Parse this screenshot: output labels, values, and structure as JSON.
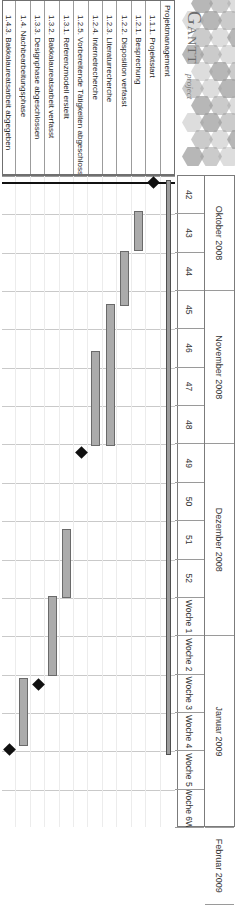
{
  "app": {
    "logo_word": "Gantt",
    "logo_sub": "project",
    "logo_icon": "honeycomb-logo"
  },
  "timeline": {
    "months": [
      {
        "label": "Oktober 2008",
        "weeks": 3
      },
      {
        "label": "November 2008",
        "weeks": 4
      },
      {
        "label": "Dezember 2008",
        "weeks": 5
      },
      {
        "label": "Januar 2009",
        "weeks": 5
      },
      {
        "label": "Februar 2009",
        "weeks": 2
      }
    ],
    "weeks": [
      "42",
      "43",
      "44",
      "45",
      "46",
      "47",
      "48",
      "49",
      "50",
      "51",
      "52",
      "Woche 1",
      "Woche 2",
      "Woche 3",
      "Woche 4",
      "Woche 5",
      "Woche 6W"
    ]
  },
  "table": {
    "column_header": "",
    "rows": [
      {
        "id": "",
        "name": "Projektmanagement",
        "level": 0,
        "type": "summary"
      },
      {
        "id": "1.1.1.",
        "name": "1.1.1. Projektstart",
        "level": 1,
        "type": "milestone"
      },
      {
        "id": "1.2.1.",
        "name": "1.2.1. Besprechung",
        "level": 1,
        "type": "task"
      },
      {
        "id": "1.2.2.",
        "name": "1.2.2. Disposition verfasst",
        "level": 1,
        "type": "task"
      },
      {
        "id": "1.2.3.",
        "name": "1.2.3. Literaturrecherche",
        "level": 1,
        "type": "task"
      },
      {
        "id": "1.2.4.",
        "name": "1.2.4. Internetrecherche",
        "level": 1,
        "type": "task"
      },
      {
        "id": "1.2.5.",
        "name": "1.2.5. Vorbereitende Tätigkeiten abgeschlossen",
        "level": 1,
        "type": "milestone"
      },
      {
        "id": "1.3.1.",
        "name": "1.3.1. Referenzmodell erstellt",
        "level": 1,
        "type": "task"
      },
      {
        "id": "1.3.2.",
        "name": "1.3.2. Bakkalaureatsarbeit verfasst",
        "level": 1,
        "type": "task"
      },
      {
        "id": "1.3.3.",
        "name": "1.3.3. Designphase abgeschlossen",
        "level": 1,
        "type": "milestone"
      },
      {
        "id": "1.4.",
        "name": "1.4. Nachbearbeitungsphase",
        "level": 1,
        "type": "task"
      },
      {
        "id": "1.4.3.",
        "name": "1.4.3. Bakkalaureatsarbeit abgegeben",
        "level": 1,
        "type": "milestone"
      }
    ]
  },
  "chart_data": {
    "type": "gantt",
    "title": "Projektmanagement",
    "xlabel": "",
    "ylabel": "",
    "week_axis": [
      "42",
      "43",
      "44",
      "45",
      "46",
      "47",
      "48",
      "49",
      "50",
      "51",
      "52",
      "Woche 1",
      "Woche 2",
      "Woche 3",
      "Woche 4",
      "Woche 5",
      "Woche 6W"
    ],
    "today_marker_week": 42.15,
    "tasks": [
      {
        "name": "Projektmanagement",
        "kind": "summary",
        "start_week": 42.1,
        "end_week": 57.1
      },
      {
        "name": "1.1.1. Projektstart",
        "kind": "milestone",
        "start_week": 42.15,
        "end_week": 42.15
      },
      {
        "name": "1.2.1. Besprechung",
        "kind": "task",
        "start_week": 42.9,
        "end_week": 43.95
      },
      {
        "name": "1.2.2. Disposition verfasst",
        "kind": "task",
        "start_week": 43.95,
        "end_week": 45.4
      },
      {
        "name": "1.2.3. Literaturrecherche",
        "kind": "task",
        "start_week": 45.35,
        "end_week": 49.05
      },
      {
        "name": "1.2.4. Internetrecherche",
        "kind": "task",
        "start_week": 46.55,
        "end_week": 49.05
      },
      {
        "name": "1.2.5. Vorbereitende Tätigkeiten abgeschlossen",
        "kind": "milestone",
        "start_week": 49.2,
        "end_week": 49.2
      },
      {
        "name": "1.3.1. Referenzmodell erstellt",
        "kind": "task",
        "start_week": 51.2,
        "end_week": 53.0
      },
      {
        "name": "1.3.2. Bakkalaureatsarbeit verfasst",
        "kind": "task",
        "start_week": 52.95,
        "end_week": 55.05
      },
      {
        "name": "1.3.3. Designphase abgeschlossen",
        "kind": "milestone",
        "start_week": 55.25,
        "end_week": 55.25
      },
      {
        "name": "1.4. Nachbearbeitungsphase",
        "kind": "task",
        "start_week": 55.1,
        "end_week": 56.85
      },
      {
        "name": "1.4.3. Bakkalaureatsarbeit abgegeben",
        "kind": "milestone",
        "start_week": 56.95,
        "end_week": 56.95
      }
    ]
  }
}
